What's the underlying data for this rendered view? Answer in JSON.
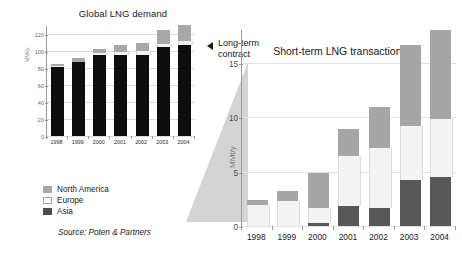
{
  "left_chart": {
    "title": "Global LNG demand",
    "ylabel": "MMt/y",
    "yticks": [
      "0",
      "20",
      "40",
      "60",
      "80",
      "100",
      "120"
    ],
    "xlabels": [
      "1998",
      "1999",
      "2000",
      "2001",
      "2002",
      "2003",
      "2004"
    ]
  },
  "right_chart": {
    "title": "Short-term LNG transactions",
    "ylabel": "MMt/y",
    "yticks": [
      "0",
      "5",
      "10",
      "15"
    ],
    "xlabels": [
      "1998",
      "1999",
      "2000",
      "2001",
      "2002",
      "2003",
      "2004"
    ]
  },
  "legend": {
    "items": [
      {
        "label": "North America",
        "color": "#a8a8a8"
      },
      {
        "label": "Europe",
        "color": "#ffffff"
      },
      {
        "label": "Asia",
        "color": "#4d4d4d"
      }
    ]
  },
  "annotation": {
    "line1": "Long-term",
    "line2": "contract",
    "arrow_icon": "left-triangle-icon"
  },
  "source": {
    "label": "Source:",
    "value": "Poten & Partners"
  },
  "chart_data": [
    {
      "type": "bar",
      "id": "global-lng-demand",
      "title": "Global LNG demand",
      "xlabel": "",
      "ylabel": "MMt/y",
      "ylim": [
        0,
        130
      ],
      "yticks": [
        0,
        20,
        40,
        60,
        80,
        100,
        120
      ],
      "grid": true,
      "stacked": true,
      "categories": [
        "1998",
        "1999",
        "2000",
        "2001",
        "2002",
        "2003",
        "2004"
      ],
      "series": [
        {
          "name": "Asia",
          "color": "#0d0d0d",
          "values": [
            82,
            87,
            96,
            96,
            96,
            105,
            108
          ]
        },
        {
          "name": "Europe",
          "color": "#f2f2f2",
          "values": [
            1,
            1,
            2,
            3,
            4,
            4,
            4
          ]
        },
        {
          "name": "North America",
          "color": "#a8a8a8",
          "values": [
            2,
            4,
            5,
            8,
            10,
            16,
            19
          ]
        }
      ],
      "totals": [
        85,
        92,
        103,
        107,
        110,
        125,
        131
      ],
      "legend_position": "below-left"
    },
    {
      "type": "bar",
      "id": "short-term-lng-transactions",
      "title": "Short-term LNG transactions",
      "xlabel": "",
      "ylabel": "MMt/y",
      "ylim": [
        0,
        18
      ],
      "yticks": [
        0,
        5,
        10,
        15
      ],
      "grid": true,
      "stacked": true,
      "categories": [
        "1998",
        "1999",
        "2000",
        "2001",
        "2002",
        "2003",
        "2004"
      ],
      "series": [
        {
          "name": "Asia",
          "color": "#585858",
          "values": [
            0.0,
            0.0,
            0.3,
            1.8,
            1.7,
            4.2,
            4.5
          ]
        },
        {
          "name": "Europe",
          "color": "#f4f4f4",
          "values": [
            1.9,
            2.3,
            1.4,
            4.6,
            5.5,
            5.0,
            5.3
          ]
        },
        {
          "name": "North America",
          "color": "#a6a6a6",
          "values": [
            0.5,
            0.9,
            3.2,
            2.5,
            3.7,
            7.4,
            8.2
          ]
        }
      ],
      "totals": [
        2.4,
        3.2,
        4.9,
        8.9,
        10.9,
        16.6,
        18.0
      ],
      "legend_position": "shared-with-left-chart"
    }
  ]
}
